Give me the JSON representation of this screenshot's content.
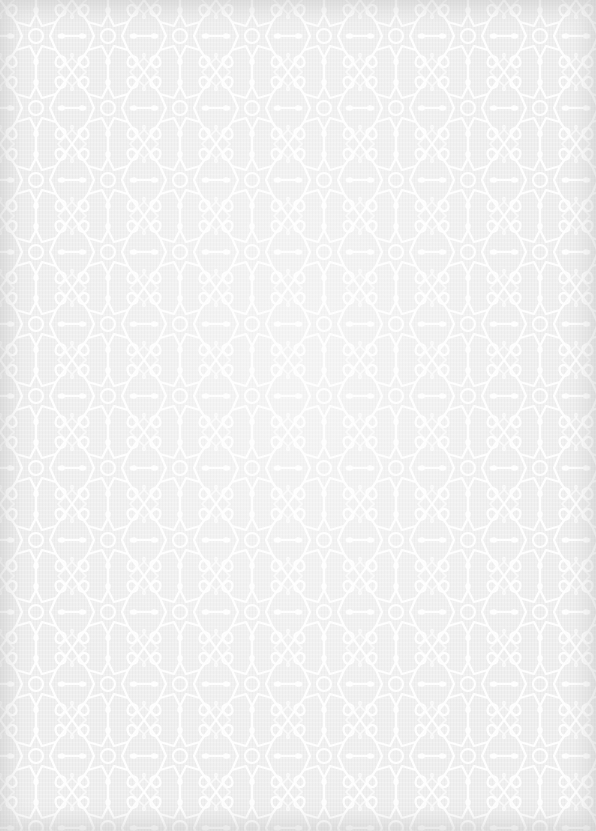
{
  "canvas": {
    "width": 596,
    "height": 831,
    "background_color": "#efefef",
    "pattern_stroke_color": "#ffffff",
    "edge_shade_color": "#a0a0a0",
    "pattern": "islamic-geometric-lattice",
    "texture": "linen"
  }
}
